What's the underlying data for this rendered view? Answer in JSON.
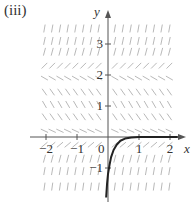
{
  "panel_label": "(iii)",
  "axes": {
    "x_label": "x",
    "y_label": "y",
    "origin_label": "0",
    "x_ticks": [
      {
        "value": -2,
        "label": "−2"
      },
      {
        "value": -1,
        "label": "−1"
      },
      {
        "value": 1,
        "label": "1"
      },
      {
        "value": 2,
        "label": "2"
      }
    ],
    "y_ticks": [
      {
        "value": 3,
        "label": "3"
      },
      {
        "value": 2,
        "label": "2"
      },
      {
        "value": 1,
        "label": "1"
      },
      {
        "value": -1,
        "label": "−1"
      }
    ],
    "xlim": [
      -2.2,
      2.55
    ],
    "ylim": [
      -2.0,
      4.0
    ]
  },
  "colors": {
    "axis": "#555555",
    "field": "#b0b0b0",
    "curve": "#222222",
    "text": "#333333"
  },
  "chart_data": {
    "type": "slope_field",
    "title": "(iii)",
    "xlabel": "x",
    "ylabel": "y",
    "x_columns": [
      -2.05,
      -1.8,
      -1.55,
      -1.3,
      -1.05,
      -0.8,
      -0.55,
      -0.3,
      0.22,
      0.48,
      0.73,
      0.98,
      1.23,
      1.48,
      1.73,
      1.98
    ],
    "rows": [
      {
        "y": 3.5,
        "slope_angle_deg": 80
      },
      {
        "y": 3.1,
        "slope_angle_deg": 78
      },
      {
        "y": 2.75,
        "slope_angle_deg": 75
      },
      {
        "y": 2.3,
        "slope_angle_deg": 45
      },
      {
        "y": 1.9,
        "slope_angle_deg": -30
      },
      {
        "y": 1.45,
        "slope_angle_deg": -55
      },
      {
        "y": 1.05,
        "slope_angle_deg": -60
      },
      {
        "y": 0.65,
        "slope_angle_deg": -55
      },
      {
        "y": 0.2,
        "slope_angle_deg": -25
      },
      {
        "y": -0.25,
        "slope_angle_deg": 40
      },
      {
        "y": -0.7,
        "slope_angle_deg": 75
      },
      {
        "y": -1.1,
        "slope_angle_deg": 80
      },
      {
        "y": -1.6,
        "slope_angle_deg": 82
      }
    ],
    "equilibria": [
      0,
      2.1
    ],
    "solution_curve": [
      [
        -0.06,
        -1.95
      ],
      [
        -0.03,
        -1.5
      ],
      [
        0.0,
        -1.2
      ],
      [
        0.05,
        -0.9
      ],
      [
        0.1,
        -0.65
      ],
      [
        0.18,
        -0.42
      ],
      [
        0.28,
        -0.25
      ],
      [
        0.4,
        -0.12
      ],
      [
        0.55,
        -0.05
      ],
      [
        0.75,
        -0.015
      ],
      [
        1.0,
        0.0
      ],
      [
        2.25,
        0.0
      ]
    ]
  }
}
